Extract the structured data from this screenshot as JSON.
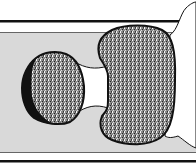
{
  "figure": {
    "colors": {
      "background": "#ffffff",
      "band": "#d9d9d9",
      "outline": "#111111",
      "stipple": "#7a7a7a",
      "stipple_light": "#b5b5b5"
    }
  }
}
